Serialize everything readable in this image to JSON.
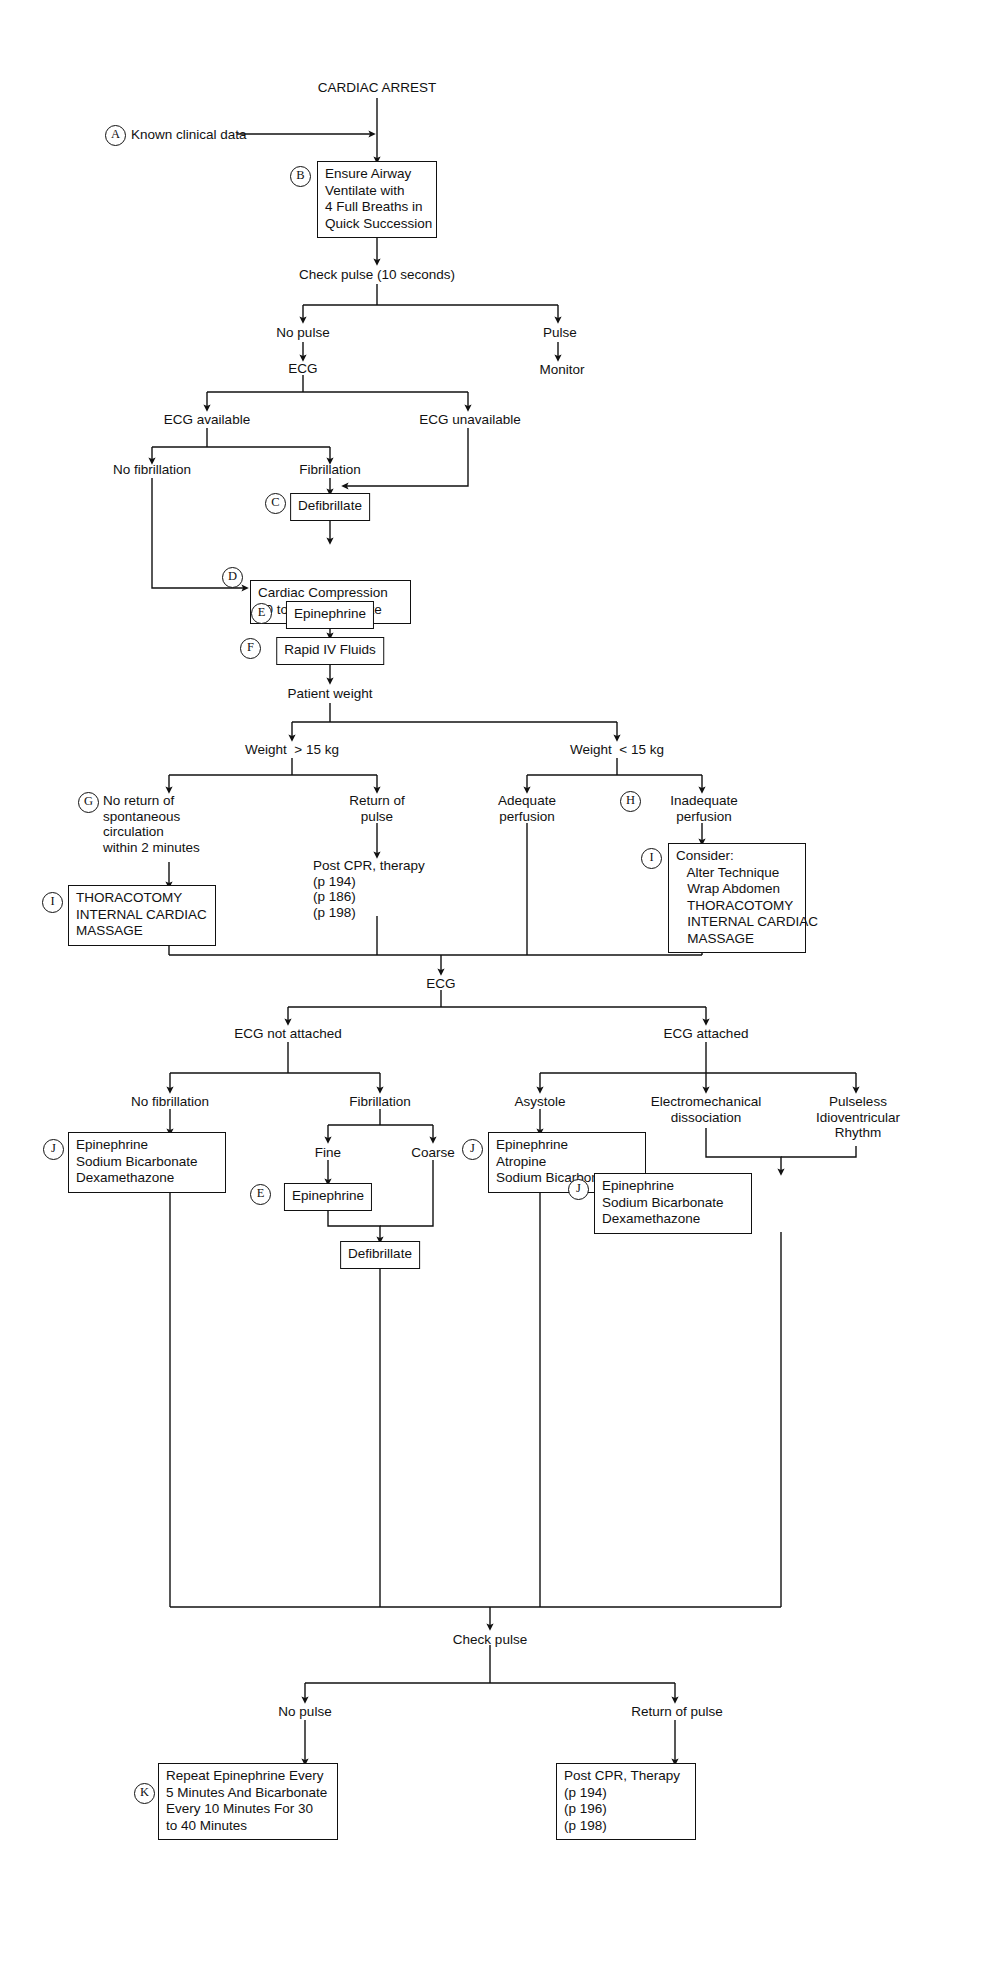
{
  "diagram": {
    "root_label": "CARDIAC ARREST",
    "line_color": "#111111",
    "background": "#ffffff"
  },
  "markers": {
    "a": "A",
    "b": "B",
    "c": "C",
    "d": "D",
    "e": "E",
    "f": "F",
    "g": "G",
    "h": "H",
    "i1": "I",
    "i2": "I",
    "i3": "I",
    "e2": "E",
    "j1": "J",
    "j2": "J",
    "j3": "J",
    "k": "K"
  },
  "labels": {
    "known_clinical_data": "Known clinical data",
    "check_pulse_10s": "Check pulse (10 seconds)",
    "no_pulse": "No pulse",
    "pulse": "Pulse",
    "monitor": "Monitor",
    "ecg_1": "ECG",
    "ecg_available": "ECG available",
    "ecg_unavailable": "ECG unavailable",
    "no_fibrillation_1": "No fibrillation",
    "fibrillation_1": "Fibrillation",
    "patient_weight": "Patient weight",
    "weight_over": "Weight  > 15 kg",
    "weight_under": "Weight  < 15 kg",
    "no_return_spont": "No return of\nspontaneous\ncirculation\nwithin 2 minutes",
    "return_of_pulse_1": "Return of\npulse",
    "post_cpr_therapy_1": "Post CPR, therapy\n(p 194)\n(p 186)\n(p 198)",
    "adequate_perfusion": "Adequate\nperfusion",
    "inadequate_perfusion": "Inadequate\nperfusion",
    "ecg_2": "ECG",
    "ecg_not_attached": "ECG not attached",
    "ecg_attached": "ECG attached",
    "no_fibrillation_2": "No fibrillation",
    "fibrillation_2": "Fibrillation",
    "fine": "Fine",
    "coarse": "Coarse",
    "asystole": "Asystole",
    "electromechanical_dissociation": "Electromechanical\ndissociation",
    "pulseless_idioventricular_rhythm": "Pulseless\nIdioventricular\nRhythm",
    "check_pulse_2": "Check pulse",
    "no_pulse_2": "No pulse",
    "return_of_pulse_2": "Return of pulse"
  },
  "boxes": {
    "ensure_airway": "Ensure Airway\nVentilate with\n4 Full Breaths in\nQuick Succession",
    "defibrillate_1": "Defibrillate",
    "cardiac_compression": "Cardiac Compression\n60 to 120 per minute",
    "epinephrine_1": "Epinephrine",
    "rapid_iv_fluids": "Rapid IV Fluids",
    "thoracotomy_left": "THORACOTOMY\nINTERNAL CARDIAC\nMASSAGE",
    "consider_box": "Consider:\n   Alter Technique\n   Wrap Abdomen\n   THORACOTOMY\n   INTERNAL CARDIAC\n   MASSAGE",
    "epi_sodbic_dex_left": "Epinephrine\nSodium Bicarbonate\nDexamethazone",
    "epinephrine_2": "Epinephrine",
    "defibrillate_2": "Defibrillate",
    "epi_atropine_sodbic": "Epinephrine\nAtropine\nSodium Bicarbonate",
    "epi_sodbic_dex_right": "Epinephrine\nSodium Bicarbonate\nDexamethazone",
    "repeat_epinephrine": "Repeat Epinephrine Every\n5 Minutes And Bicarbonate\nEvery 10 Minutes For 30\nto 40 Minutes",
    "post_cpr_therapy_2": "Post CPR, Therapy\n(p 194)\n(p 196)\n(p 198)"
  }
}
